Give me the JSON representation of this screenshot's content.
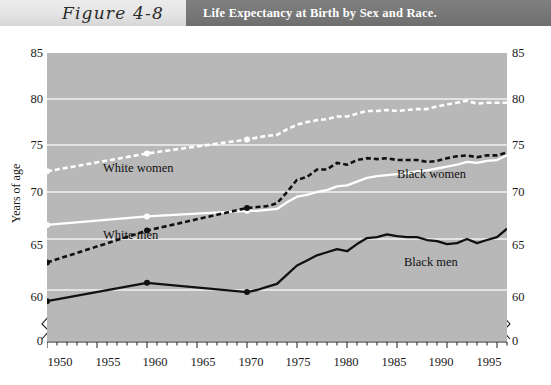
{
  "header": {
    "figure_label": "Figure 4-8",
    "title": "Life Expectancy at Birth by Sex and Race."
  },
  "axes": {
    "y_title": "Years of age",
    "y_ticks": [
      "0",
      "60",
      "65",
      "70",
      "75",
      "80",
      "85"
    ],
    "x_ticks": [
      "1950",
      "1955",
      "1960",
      "1965",
      "1970",
      "1975",
      "1980",
      "1985",
      "1990",
      "1995"
    ],
    "zero_left": "0",
    "zero_right": "0"
  },
  "series_labels": {
    "white_women": "White women",
    "white_men": "White men",
    "black_women": "Black women",
    "black_men": "Black men"
  },
  "colors": {
    "plot_background": "#b8b8b8",
    "gridline": "#f2f2f2",
    "white_series": "#ffffff",
    "black_series": "#111111",
    "header_band": "#767676",
    "figure_band": "#e4e4e4",
    "page": "#ffffff"
  },
  "chart_data": {
    "type": "line",
    "title": "Life Expectancy at Birth by Sex and Race.",
    "xlabel": "",
    "ylabel": "Years of age",
    "xlim": [
      1950,
      1996
    ],
    "ylim": [
      58,
      85
    ],
    "y_axis_break": true,
    "grid": "horizontal",
    "legend": "inline-annotations",
    "x_major_tick_interval": 5,
    "x_minor_tick_interval": 1,
    "series": [
      {
        "name": "White women",
        "style": "dashed",
        "color": "#ffffff",
        "markers_at": [
          1950,
          1960,
          1970
        ],
        "x": [
          1950,
          1960,
          1970,
          1971,
          1972,
          1973,
          1974,
          1975,
          1976,
          1977,
          1978,
          1979,
          1980,
          1981,
          1982,
          1983,
          1984,
          1985,
          1986,
          1987,
          1988,
          1989,
          1990,
          1991,
          1992,
          1993,
          1994,
          1995,
          1996
        ],
        "values": [
          72.2,
          74.1,
          75.6,
          75.8,
          76.0,
          76.1,
          76.7,
          77.2,
          77.5,
          77.7,
          77.8,
          78.1,
          78.1,
          78.4,
          78.7,
          78.7,
          78.8,
          78.7,
          78.8,
          78.9,
          78.9,
          79.2,
          79.4,
          79.6,
          79.8,
          79.5,
          79.6,
          79.6,
          79.6
        ]
      },
      {
        "name": "White men",
        "style": "solid",
        "color": "#ffffff",
        "markers_at": [
          1950,
          1960,
          1970
        ],
        "x": [
          1950,
          1960,
          1970,
          1971,
          1972,
          1973,
          1974,
          1975,
          1976,
          1977,
          1978,
          1979,
          1980,
          1981,
          1982,
          1983,
          1984,
          1985,
          1986,
          1987,
          1988,
          1989,
          1990,
          1991,
          1992,
          1993,
          1994,
          1995,
          1996
        ],
        "values": [
          66.5,
          67.4,
          68.0,
          68.0,
          68.1,
          68.2,
          68.9,
          69.5,
          69.7,
          70.0,
          70.2,
          70.6,
          70.7,
          71.1,
          71.5,
          71.7,
          71.8,
          71.9,
          72.0,
          72.2,
          72.3,
          72.5,
          72.7,
          72.9,
          73.2,
          73.1,
          73.3,
          73.4,
          73.9
        ]
      },
      {
        "name": "Black women",
        "style": "dashed",
        "color": "#111111",
        "markers_at": [
          1950,
          1960,
          1970
        ],
        "x": [
          1950,
          1960,
          1970,
          1971,
          1972,
          1973,
          1974,
          1975,
          1976,
          1977,
          1978,
          1979,
          1980,
          1981,
          1982,
          1983,
          1984,
          1985,
          1986,
          1987,
          1988,
          1989,
          1990,
          1991,
          1992,
          1993,
          1994,
          1995,
          1996
        ],
        "values": [
          62.7,
          65.9,
          68.3,
          68.4,
          68.5,
          68.8,
          70.0,
          71.3,
          71.6,
          72.4,
          72.4,
          73.1,
          72.9,
          73.4,
          73.6,
          73.5,
          73.6,
          73.4,
          73.4,
          73.4,
          73.2,
          73.3,
          73.6,
          73.8,
          73.9,
          73.7,
          73.9,
          73.9,
          74.2
        ]
      },
      {
        "name": "Black men",
        "style": "solid",
        "color": "#111111",
        "markers_at": [
          1950,
          1960,
          1970
        ],
        "x": [
          1950,
          1960,
          1970,
          1971,
          1972,
          1973,
          1974,
          1975,
          1976,
          1977,
          1978,
          1979,
          1980,
          1981,
          1982,
          1983,
          1984,
          1985,
          1986,
          1987,
          1988,
          1989,
          1990,
          1991,
          1992,
          1993,
          1994,
          1995,
          1996
        ],
        "values": [
          58.9,
          60.7,
          59.8,
          60.0,
          60.3,
          60.6,
          61.5,
          62.4,
          62.9,
          63.4,
          63.7,
          64.0,
          63.8,
          64.5,
          65.1,
          65.2,
          65.5,
          65.3,
          65.2,
          65.2,
          64.9,
          64.8,
          64.5,
          64.6,
          65.0,
          64.6,
          64.9,
          65.2,
          66.1
        ]
      }
    ]
  }
}
